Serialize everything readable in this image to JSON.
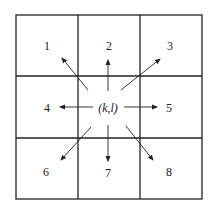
{
  "diagram": {
    "title": "",
    "center": {
      "label": "(k,l)"
    },
    "neighbors": [
      {
        "id": 1,
        "label": "1",
        "position": "top-left"
      },
      {
        "id": 2,
        "label": "2",
        "position": "top"
      },
      {
        "id": 3,
        "label": "3",
        "position": "top-right"
      },
      {
        "id": 4,
        "label": "4",
        "position": "left"
      },
      {
        "id": 5,
        "label": "5",
        "position": "right"
      },
      {
        "id": 6,
        "label": "6",
        "position": "bottom-left"
      },
      {
        "id": 7,
        "label": "7",
        "position": "bottom"
      },
      {
        "id": 8,
        "label": "8",
        "position": "bottom-right"
      }
    ],
    "grid": {
      "rows": 3,
      "cols": 3,
      "line_color": "#222222"
    },
    "arrow_color": "#222222"
  }
}
